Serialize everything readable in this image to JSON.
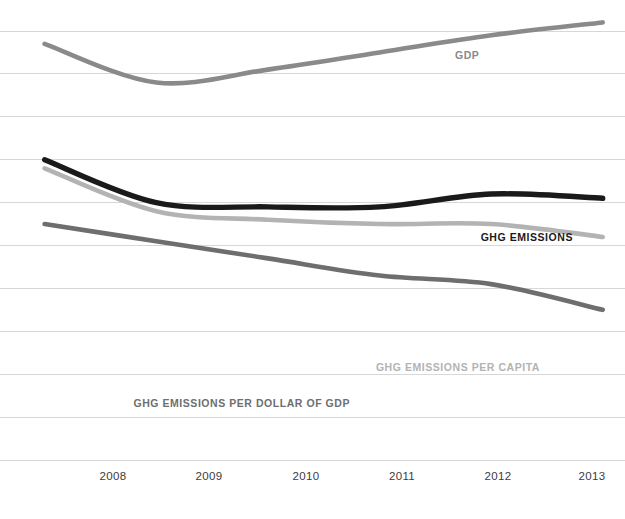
{
  "chart_data": {
    "type": "line",
    "title": "",
    "subtitle": "",
    "xlabel": "",
    "ylabel": "",
    "grid": true,
    "grid_orientation": "horizontal",
    "gridline_count": 11,
    "legend_position": "inline-annotations",
    "x": [
      2008,
      2009,
      2010,
      2011,
      2012,
      2013
    ],
    "xlim": [
      2007.6,
      2013.2
    ],
    "ylim": [
      0,
      100
    ],
    "axis_values_shown": false,
    "series": [
      {
        "name": "GDP",
        "label": "GDP",
        "color": "#8a8a8a",
        "stroke_width": 4.6,
        "values": [
          97,
          88,
          91,
          95,
          99,
          102
        ],
        "label_x": 455,
        "label_y": 49,
        "label_align": "start"
      },
      {
        "name": "GHG EMISSIONS",
        "label": "GHG EMISSIONS",
        "color": "#1a1a1a",
        "stroke_width": 5.4,
        "values": [
          70,
          60,
          59,
          59,
          62,
          61
        ],
        "label_x": 573,
        "label_y": 231,
        "label_align": "end"
      },
      {
        "name": "GHG EMISSIONS PER CAPITA",
        "label": "GHG EMISSIONS PER CAPITA",
        "color": "#b3b3b3",
        "stroke_width": 4.6,
        "values": [
          68,
          58,
          56,
          55,
          55,
          52
        ],
        "label_x": 540,
        "label_y": 361,
        "label_align": "end"
      },
      {
        "name": "GHG EMISSIONS PER DOLLAR OF GDP",
        "label": "GHG EMISSIONS PER DOLLAR OF GDP",
        "color": "#6e6e6e",
        "stroke_width": 4.6,
        "values": [
          55,
          51,
          47,
          43,
          41,
          35
        ],
        "label_x": 350,
        "label_y": 397,
        "label_align": "end"
      }
    ],
    "tick_labels": [
      {
        "text": "2008",
        "x": 113
      },
      {
        "text": "2009",
        "x": 209
      },
      {
        "text": "2010",
        "x": 306
      },
      {
        "text": "2011",
        "x": 402
      },
      {
        "text": "2012",
        "x": 498
      },
      {
        "text": "2013",
        "x": 592
      }
    ]
  },
  "colors": {
    "background": "#ffffff",
    "gridline": "#d3d3d3",
    "tick_text": "#3c3c3c",
    "gdp": "#8a8a8a",
    "ghg_emissions": "#1a1a1a",
    "ghg_per_capita": "#b3b3b3",
    "ghg_per_dollar_gdp": "#6e6e6e"
  }
}
